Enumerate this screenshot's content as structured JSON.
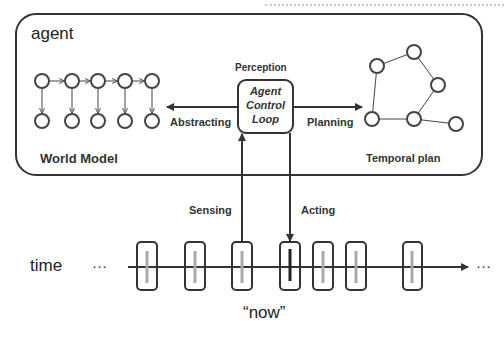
{
  "diagram": {
    "agent_box": {
      "label": "agent"
    },
    "world_model": {
      "label": "World Model",
      "top_row_nodes": 5,
      "bottom_row_nodes": 5
    },
    "control_loop": {
      "title_above": "Perception",
      "lines": [
        "Agent",
        "Control",
        "Loop"
      ]
    },
    "temporal_plan": {
      "label": "Temporal plan",
      "nodes": 6
    },
    "arrows": {
      "abstracting": "Abstracting",
      "planning": "Planning",
      "sensing": "Sensing",
      "acting": "Acting"
    },
    "timeline": {
      "label": "time",
      "left_ellipsis": "···",
      "right_ellipsis": "···",
      "now_label": "“now”",
      "frames": 7,
      "current_frame_index": 3
    },
    "colors": {
      "stroke": "#333333",
      "frame_past": "#aaaaaa",
      "frame_now": "#222222"
    }
  }
}
